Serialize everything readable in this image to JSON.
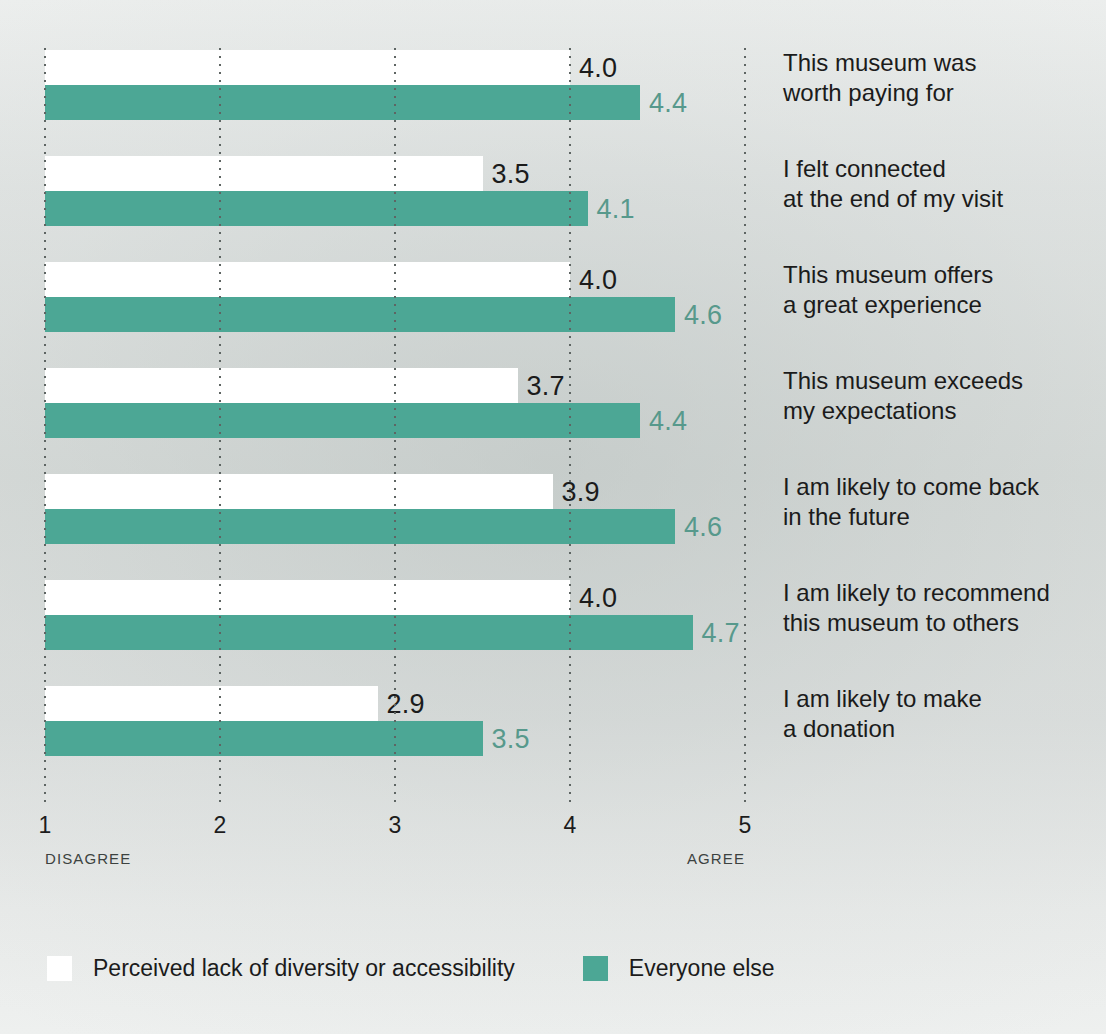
{
  "colors": {
    "teal": "#4ca795",
    "white": "#ffffff",
    "background": "#d6dad8",
    "teal_label": "#57998c",
    "text": "#1b1b1b",
    "gridline": "#5e6563"
  },
  "axis": {
    "ticks": [
      "1",
      "2",
      "3",
      "4",
      "5"
    ],
    "anchor_low": "DISAGREE",
    "anchor_high": "AGREE"
  },
  "legend": {
    "items": [
      {
        "label": "Perceived lack of diversity or accessibility",
        "color": "#ffffff",
        "swatch": "white"
      },
      {
        "label": "Everyone else",
        "color": "#4ca795",
        "swatch": "teal"
      }
    ]
  },
  "chart_data": {
    "type": "bar",
    "orientation": "horizontal",
    "title": "",
    "subtitle": "",
    "xlabel": "",
    "ylabel": "",
    "xlim": [
      1,
      5
    ],
    "xticks": [
      1,
      2,
      3,
      4,
      5
    ],
    "grid": true,
    "grid_axis": "x",
    "grid_style": "dotted",
    "legend_position": "bottom-left",
    "axis_anchor_low": "DISAGREE",
    "axis_anchor_high": "AGREE",
    "categories": [
      "This museum was\nworth paying for",
      "I felt connected\nat the end of my visit",
      "This museum offers\na great experience",
      "This museum exceeds\nmy expectations",
      "I am likely to come back\nin the future",
      "I am likely to recommend\nthis museum to others",
      "I am likely to make\na donation"
    ],
    "series": [
      {
        "name": "Perceived lack of diversity or accessibility",
        "color": "#ffffff",
        "label_color": "#1b1b1b",
        "values": [
          4.0,
          3.5,
          4.0,
          3.7,
          3.9,
          4.0,
          2.9
        ],
        "labels": [
          "4.0",
          "3.5",
          "4.0",
          "3.7",
          "3.9",
          "4.0",
          "2.9"
        ]
      },
      {
        "name": "Everyone else",
        "color": "#4ca795",
        "label_color": "#57998c",
        "values": [
          4.4,
          4.1,
          4.6,
          4.4,
          4.6,
          4.7,
          3.5
        ],
        "labels": [
          "4.4",
          "4.1",
          "4.6",
          "4.4",
          "4.6",
          "4.7",
          "3.5"
        ]
      }
    ]
  }
}
